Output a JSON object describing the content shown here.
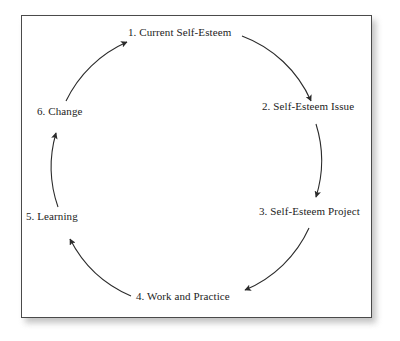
{
  "figure": {
    "type": "cycle-diagram",
    "direction": "clockwise",
    "frame": {
      "border_color": "#4a4a4a",
      "background": "#ffffff"
    },
    "text_color": "#1c1c1c",
    "arrow_color": "#2b2b2b"
  },
  "nodes": [
    {
      "id": "stage-1",
      "label": "1. Current Self-Esteem"
    },
    {
      "id": "stage-2",
      "label": "2. Self-Esteem Issue"
    },
    {
      "id": "stage-3",
      "label": "3. Self-Esteem Project"
    },
    {
      "id": "stage-4",
      "label": "4. Work and Practice"
    },
    {
      "id": "stage-5",
      "label": "5. Learning"
    },
    {
      "id": "stage-6",
      "label": "6. Change"
    }
  ],
  "arrows": [
    {
      "from": "stage-1",
      "to": "stage-2"
    },
    {
      "from": "stage-2",
      "to": "stage-3"
    },
    {
      "from": "stage-3",
      "to": "stage-4"
    },
    {
      "from": "stage-4",
      "to": "stage-5"
    },
    {
      "from": "stage-5",
      "to": "stage-6"
    },
    {
      "from": "stage-6",
      "to": "stage-1"
    }
  ]
}
